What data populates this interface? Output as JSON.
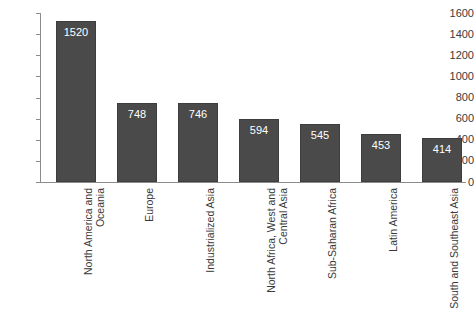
{
  "chart_data": {
    "type": "bar",
    "title": "",
    "subtitle": "",
    "xlabel": "",
    "ylabel": "",
    "grid": false,
    "legend": "none",
    "ylim": [
      0,
      1600
    ],
    "yticks": [
      1600,
      1400,
      1200,
      1000,
      800,
      600,
      400,
      200,
      0
    ],
    "categories": [
      "North America and\nOceania",
      "Europe",
      "Industrialized Asia",
      "North Africa, West and\nCentral Asia",
      "Sub-Saharan Africa",
      "Latin America",
      "South and Southeast Asia"
    ],
    "values": [
      1520,
      748,
      746,
      594,
      545,
      453,
      414
    ],
    "value_labels": [
      "1520",
      "748",
      "746",
      "594",
      "545",
      "453",
      "414"
    ],
    "colors": {
      "bar_fill": "#4a4a4a",
      "bar_border": "#3d3d3d",
      "value_text": "#ffffff",
      "axis": "#8c8c8c",
      "tick_text": "#3a3a3a",
      "background": "#ffffff"
    }
  }
}
